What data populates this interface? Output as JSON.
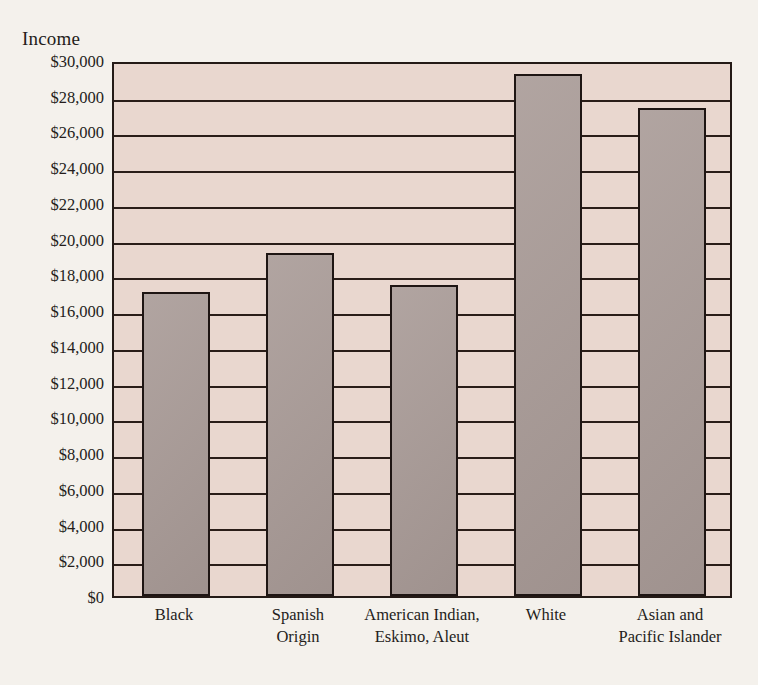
{
  "chart_data": {
    "type": "bar",
    "title": "",
    "ylabel": "Income",
    "xlabel": "",
    "ylim": [
      0,
      30000
    ],
    "ytick_step": 2000,
    "grid": true,
    "legend": "none",
    "categories": [
      "Black",
      "Spanish Origin",
      "American Indian, Eskimo, Aleut",
      "White",
      "Asian and Pacific Islander"
    ],
    "category_lines": [
      [
        "Black",
        ""
      ],
      [
        "Spanish",
        "Origin"
      ],
      [
        "American Indian,",
        "Eskimo, Aleut"
      ],
      [
        "White",
        ""
      ],
      [
        "Asian and",
        "Pacific Islander"
      ]
    ],
    "values": [
      17000,
      19200,
      17400,
      29200,
      27300
    ],
    "ytick_labels": [
      "$30,000",
      "$28,000",
      "$26,000",
      "$24,000",
      "$22,000",
      "$20,000",
      "$18,000",
      "$16,000",
      "$14,000",
      "$12,000",
      "$10,000",
      "$8,000",
      "$6,000",
      "$4,000",
      "$2,000",
      "$0"
    ],
    "ytick_values": [
      30000,
      28000,
      26000,
      24000,
      22000,
      20000,
      18000,
      16000,
      14000,
      12000,
      10000,
      8000,
      6000,
      4000,
      2000,
      0
    ]
  },
  "colors": {
    "page_background": "#f4f1ec",
    "plot_background": "#e9d7cf",
    "bar_fill": "#a89a96",
    "bar_border": "#1e1513",
    "gridline": "#2a1d18",
    "text": "#241d1b"
  }
}
